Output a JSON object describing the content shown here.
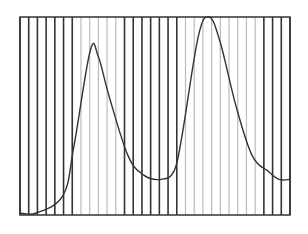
{
  "chart_data": {
    "type": "line",
    "title": "",
    "xlabel": "",
    "ylabel": "",
    "grid": "vertical bands (dark and light vertical lines)",
    "legend": null,
    "frame": {
      "x0": 20,
      "y0": 17,
      "x1": 290,
      "y1": 215
    },
    "vertical_lines": {
      "count": 32,
      "pattern": [
        "dark",
        "dark",
        "dark",
        "dark",
        "dark",
        "dark",
        "dark",
        "light",
        "light",
        "light",
        "light",
        "light",
        "dark",
        "dark",
        "dark",
        "dark",
        "dark",
        "dark",
        "dark",
        "light",
        "light",
        "light",
        "light",
        "light",
        "light",
        "light",
        "light",
        "light",
        "dark",
        "dark",
        "dark",
        "dark"
      ]
    },
    "x": [
      0,
      0.06,
      0.16,
      0.2,
      0.26,
      0.29,
      0.33,
      0.4,
      0.46,
      0.52,
      0.57,
      0.6,
      0.66,
      0.7,
      0.74,
      0.8,
      0.86,
      0.92,
      0.96,
      1.0
    ],
    "values": [
      0.01,
      0.01,
      0.1,
      0.35,
      0.83,
      0.8,
      0.6,
      0.3,
      0.2,
      0.18,
      0.22,
      0.4,
      0.9,
      1.0,
      0.88,
      0.55,
      0.3,
      0.22,
      0.18,
      0.18
    ],
    "ylim": [
      0,
      1
    ],
    "xlim": [
      0,
      1
    ],
    "colors": {
      "curve": "#333333",
      "dark_line": "#333333",
      "light_line": "#bbbbbb",
      "frame": "#333333"
    },
    "annotations": []
  }
}
